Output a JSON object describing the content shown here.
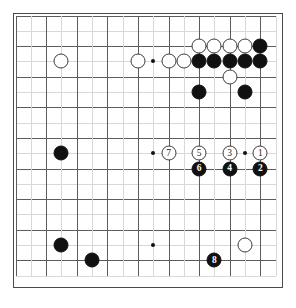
{
  "board": {
    "title": "Go board diagram",
    "size": 18,
    "columns": 18,
    "rows": 18,
    "colors": {
      "black_stone": "#111111",
      "white_stone": "#ffffff",
      "stone_outline": "#3c3c3c",
      "grid_line": "#5c5c5c",
      "board_background": "#ffffff",
      "board_border": "#4a4a4a"
    },
    "star_points": [
      {
        "col": 9,
        "row": 3
      },
      {
        "col": 9,
        "row": 9
      },
      {
        "col": 9,
        "row": 15
      },
      {
        "col": 15,
        "row": 9
      }
    ],
    "stones": [
      {
        "col": 3,
        "row": 3,
        "color": "white",
        "label": ""
      },
      {
        "col": 8,
        "row": 3,
        "color": "white",
        "label": ""
      },
      {
        "col": 10,
        "row": 3,
        "color": "white",
        "label": ""
      },
      {
        "col": 11,
        "row": 3,
        "color": "white",
        "label": ""
      },
      {
        "col": 12,
        "row": 2,
        "color": "white",
        "label": ""
      },
      {
        "col": 13,
        "row": 2,
        "color": "white",
        "label": ""
      },
      {
        "col": 14,
        "row": 2,
        "color": "white",
        "label": ""
      },
      {
        "col": 15,
        "row": 2,
        "color": "white",
        "label": ""
      },
      {
        "col": 16,
        "row": 2,
        "color": "black",
        "label": ""
      },
      {
        "col": 12,
        "row": 3,
        "color": "black",
        "label": ""
      },
      {
        "col": 13,
        "row": 3,
        "color": "black",
        "label": ""
      },
      {
        "col": 14,
        "row": 3,
        "color": "black",
        "label": ""
      },
      {
        "col": 15,
        "row": 3,
        "color": "black",
        "label": ""
      },
      {
        "col": 16,
        "row": 3,
        "color": "black",
        "label": ""
      },
      {
        "col": 14,
        "row": 4,
        "color": "white",
        "label": ""
      },
      {
        "col": 12,
        "row": 5,
        "color": "black",
        "label": ""
      },
      {
        "col": 15,
        "row": 5,
        "color": "black",
        "label": ""
      },
      {
        "col": 3,
        "row": 9,
        "color": "black",
        "label": ""
      },
      {
        "col": 10,
        "row": 9,
        "color": "white",
        "label": "7"
      },
      {
        "col": 12,
        "row": 9,
        "color": "white",
        "label": "5"
      },
      {
        "col": 14,
        "row": 9,
        "color": "white",
        "label": "3"
      },
      {
        "col": 16,
        "row": 9,
        "color": "white",
        "label": "1"
      },
      {
        "col": 12,
        "row": 10,
        "color": "black",
        "label": "6"
      },
      {
        "col": 14,
        "row": 10,
        "color": "black",
        "label": "4"
      },
      {
        "col": 16,
        "row": 10,
        "color": "black",
        "label": "2"
      },
      {
        "col": 3,
        "row": 15,
        "color": "black",
        "label": ""
      },
      {
        "col": 5,
        "row": 16,
        "color": "black",
        "label": ""
      },
      {
        "col": 15,
        "row": 15,
        "color": "white",
        "label": ""
      },
      {
        "col": 13,
        "row": 16,
        "color": "black",
        "label": "8"
      }
    ]
  }
}
